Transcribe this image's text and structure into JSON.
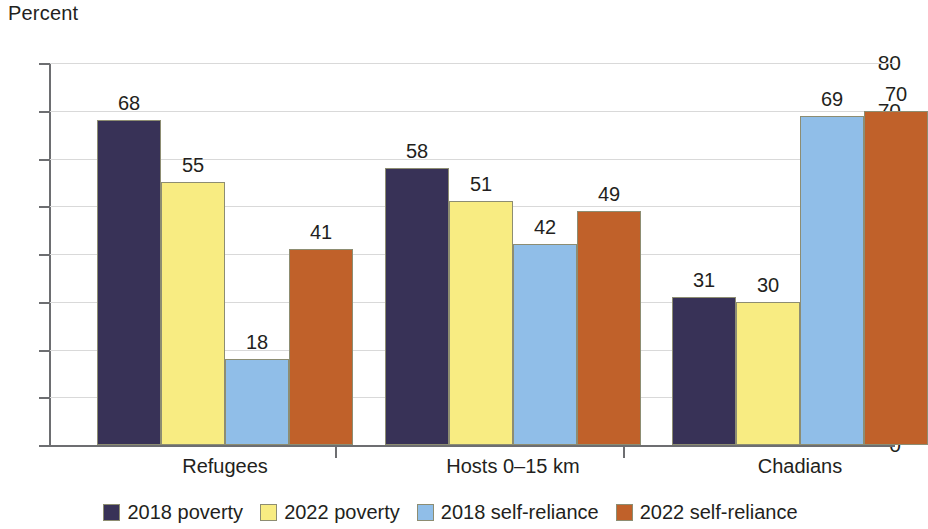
{
  "chart_data": {
    "type": "bar",
    "title": "",
    "subtitle": "",
    "xlabel": "",
    "ylabel": "Percent",
    "ylim": [
      0,
      80
    ],
    "ytick_step": 10,
    "yticks": [
      "80",
      "70",
      "60",
      "50",
      "40",
      "30",
      "20",
      "10",
      "0"
    ],
    "grid": "horizontal",
    "legend_position": "bottom",
    "categories": [
      "Refugees",
      "Hosts 0–15 km",
      "Chadians"
    ],
    "series": [
      {
        "name": "2018 poverty",
        "color": "#383257",
        "values": [
          68,
          55,
          31
        ]
      },
      {
        "name": "2022 poverty",
        "color": "#f8ec82",
        "values": [
          55,
          51,
          30
        ]
      },
      {
        "name": "2018 self-reliance",
        "color": "#90bee8",
        "values": [
          18,
          42,
          69
        ]
      },
      {
        "name": "2022 self-reliance",
        "color": "#c0612a",
        "values": [
          41,
          49,
          70
        ]
      }
    ],
    "data_labels": [
      [
        "68",
        "55",
        "18",
        "41"
      ],
      [
        "58",
        "51",
        "42",
        "49"
      ],
      [
        "31",
        "30",
        "69",
        "70"
      ]
    ],
    "bar_values_by_group": [
      [
        68,
        55,
        18,
        41
      ],
      [
        58,
        51,
        42,
        49
      ],
      [
        31,
        30,
        69,
        70
      ]
    ],
    "bar_border_color": "#8d8d72",
    "gridline_color": "#d9d9d9",
    "axis_color": "#6d6e71",
    "text_color": "#231f20",
    "background": "#ffffff"
  },
  "legend": {
    "items": [
      {
        "label": "2018 poverty",
        "color": "#383257"
      },
      {
        "label": "2022 poverty",
        "color": "#f8ec82"
      },
      {
        "label": "2018 self-reliance",
        "color": "#90bee8"
      },
      {
        "label": "2022 self-reliance",
        "color": "#c0612a"
      }
    ]
  }
}
